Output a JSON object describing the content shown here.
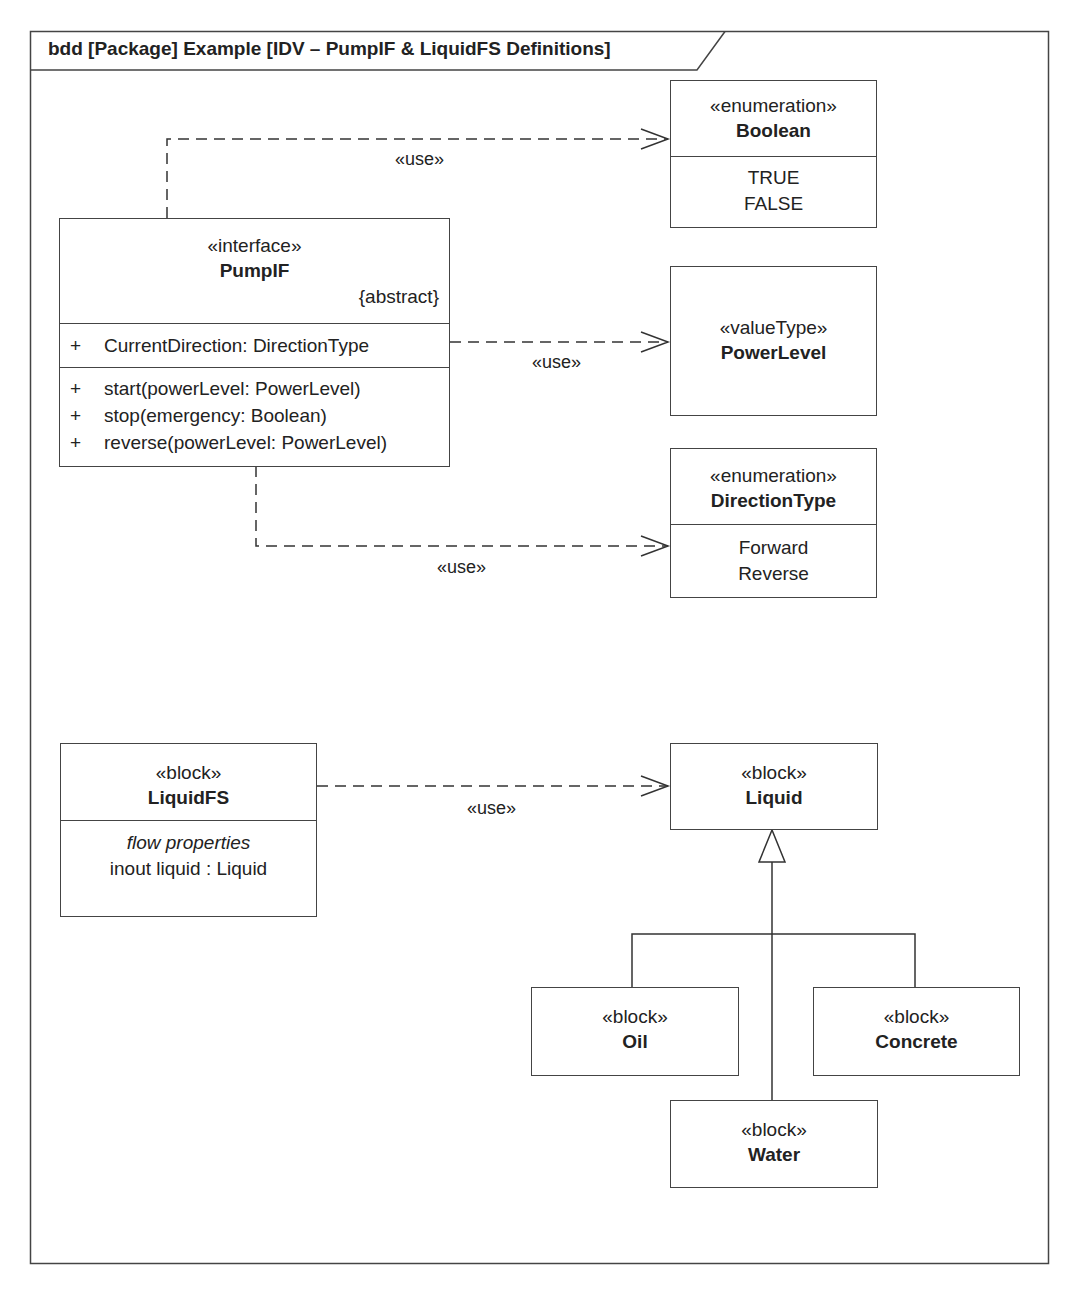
{
  "frame": {
    "title": "bdd [Package] Example [IDV – PumpIF & LiquidFS Definitions]"
  },
  "elements": {
    "pumpif": {
      "stereotype": "«interface»",
      "name": "PumpIF",
      "constraint": "{abstract}",
      "properties": [
        {
          "visibility": "+",
          "signature": "CurrentDirection: DirectionType"
        }
      ],
      "operations": [
        {
          "visibility": "+",
          "signature": "start(powerLevel: PowerLevel)"
        },
        {
          "visibility": "+",
          "signature": "stop(emergency: Boolean)"
        },
        {
          "visibility": "+",
          "signature": "reverse(powerLevel: PowerLevel)"
        }
      ]
    },
    "boolean": {
      "stereotype": "«enumeration»",
      "name": "Boolean",
      "literals": [
        "TRUE",
        "FALSE"
      ]
    },
    "powerlevel": {
      "stereotype": "«valueType»",
      "name": "PowerLevel"
    },
    "directiontype": {
      "stereotype": "«enumeration»",
      "name": "DirectionType",
      "literals": [
        "Forward",
        "Reverse"
      ]
    },
    "liquidfs": {
      "stereotype": "«block»",
      "name": "LiquidFS",
      "compartment_title": "flow properties",
      "flow_properties": [
        "inout liquid : Liquid"
      ]
    },
    "liquid": {
      "stereotype": "«block»",
      "name": "Liquid"
    },
    "oil": {
      "stereotype": "«block»",
      "name": "Oil"
    },
    "concrete": {
      "stereotype": "«block»",
      "name": "Concrete"
    },
    "water": {
      "stereotype": "«block»",
      "name": "Water"
    }
  },
  "relationships": {
    "use_boolean": {
      "type": "dependency",
      "label": "«use»",
      "from": "PumpIF",
      "to": "Boolean"
    },
    "use_powerlevel": {
      "type": "dependency",
      "label": "«use»",
      "from": "PumpIF",
      "to": "PowerLevel"
    },
    "use_directiontype": {
      "type": "dependency",
      "label": "«use»",
      "from": "PumpIF",
      "to": "DirectionType"
    },
    "use_liquid": {
      "type": "dependency",
      "label": "«use»",
      "from": "LiquidFS",
      "to": "Liquid"
    },
    "generalizations": [
      {
        "type": "generalization",
        "from": "Oil",
        "to": "Liquid"
      },
      {
        "type": "generalization",
        "from": "Water",
        "to": "Liquid"
      },
      {
        "type": "generalization",
        "from": "Concrete",
        "to": "Liquid"
      }
    ]
  }
}
